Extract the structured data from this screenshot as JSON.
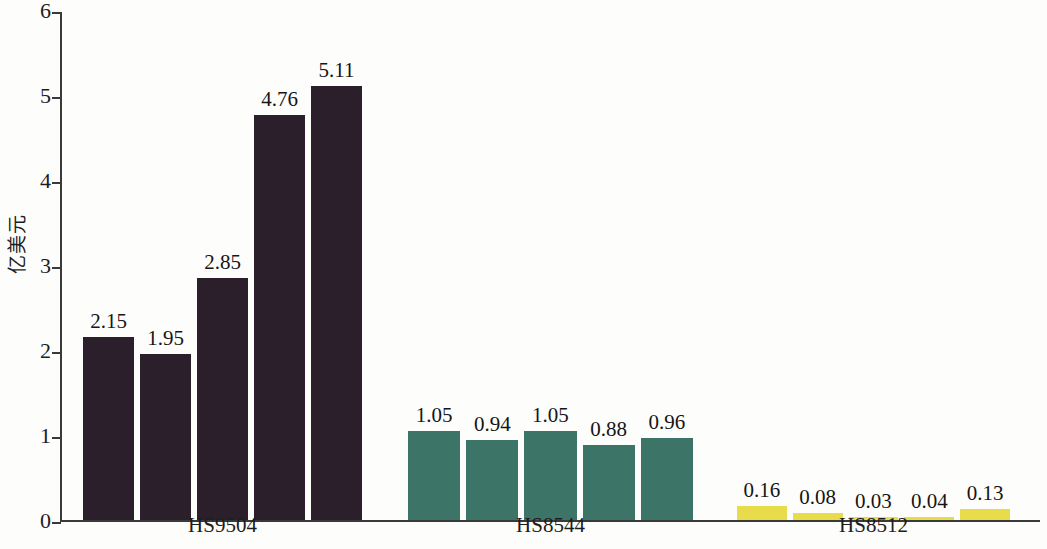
{
  "chart_data": {
    "type": "bar",
    "title": "",
    "subtitle": "",
    "xlabel": "",
    "ylabel": "亿美元",
    "ylim": [
      0,
      6
    ],
    "yticks": [
      0,
      1,
      2,
      3,
      4,
      5,
      6
    ],
    "ytick_labels": [
      "0",
      "1",
      "2",
      "3",
      "4",
      "5",
      "6"
    ],
    "grid": false,
    "legend": "none",
    "categories": [
      "HS9504",
      "HS8544",
      "HS8512"
    ],
    "bars_per_category": 5,
    "groups": [
      {
        "label": "HS9504",
        "color": "#2b1f2b",
        "values": [
          2.15,
          1.95,
          2.85,
          4.76,
          5.11
        ],
        "value_labels": [
          "2.15",
          "1.95",
          "2.85",
          "4.76",
          "5.11"
        ]
      },
      {
        "label": "HS8544",
        "color": "#3d7468",
        "values": [
          1.05,
          0.94,
          1.05,
          0.88,
          0.96
        ],
        "value_labels": [
          "1.05",
          "0.94",
          "1.05",
          "0.88",
          "0.96"
        ]
      },
      {
        "label": "HS8512",
        "color": "#e8dc4a",
        "values": [
          0.16,
          0.08,
          0.03,
          0.04,
          0.13
        ],
        "value_labels": [
          "0.16",
          "0.08",
          "0.03",
          "0.04",
          "0.13"
        ]
      }
    ]
  },
  "colors": {
    "group_1": "#2b1f2b",
    "group_2": "#3d7468",
    "group_3": "#e8dc4a",
    "axis": "#3a3a3a",
    "text": "#1d1d1d",
    "background": "#fdfdfc"
  }
}
